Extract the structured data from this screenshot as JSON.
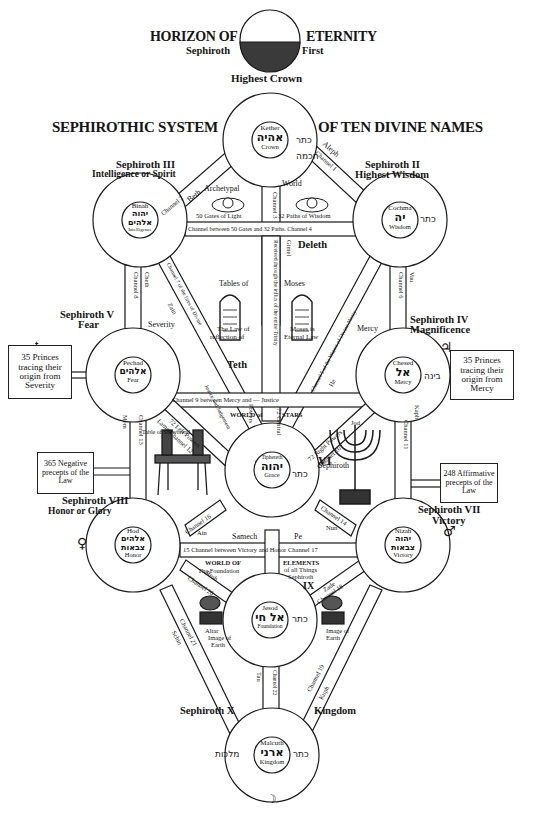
{
  "header": {
    "horizon_left": "HORIZON OF",
    "horizon_right": "ETERNITY",
    "sephiroth_label": "Sephiroth",
    "first_label": "First",
    "highest_crown": "Highest Crown",
    "system_left": "SEPHIROTHIC SYSTEM",
    "system_right": "OF TEN DIVINE NAMES"
  },
  "sephiroth": [
    {
      "id": "keter",
      "name": "Kether",
      "hebrew": "אהיה",
      "english": "Crown",
      "title": "Sephiroth First",
      "subtitle": "Highest Crown"
    },
    {
      "id": "chokmah",
      "name": "Cochma",
      "hebrew": "יה",
      "english": "Wisdom",
      "title": "Sephiroth II",
      "subtitle": "Highest Wisdom"
    },
    {
      "id": "binah",
      "name": "Binah",
      "hebrew": "יהוה אלהים",
      "english": "Intelligence",
      "title": "Sephiroth III",
      "subtitle": "Intelligence or Spirit"
    },
    {
      "id": "chesed",
      "name": "Chesed",
      "hebrew": "אל",
      "english": "Mercy",
      "title": "Sephiroth IV",
      "subtitle": "Magnificence"
    },
    {
      "id": "pechad",
      "name": "Pechad",
      "hebrew": "אלהים",
      "english": "Fear",
      "title": "Sephiroth V",
      "subtitle": "Fear"
    },
    {
      "id": "tiphereth",
      "name": "Tiphereth",
      "hebrew": "יהוה",
      "english": "Grace",
      "title": "Sephiroth",
      "subtitle": "VI"
    },
    {
      "id": "nizah",
      "name": "Nizah",
      "hebrew": "יהוה צבאות",
      "english": "Victory",
      "title": "Sephiroth VII",
      "subtitle": "Victory"
    },
    {
      "id": "hod",
      "name": "Hod",
      "hebrew": "אלהים צבאות",
      "english": "Honor",
      "title": "Sephiroth VIII",
      "subtitle": "Honor or Glory"
    },
    {
      "id": "jesod",
      "name": "Jesod",
      "hebrew": "אל חי",
      "english": "Foundation",
      "title": "Sephiroth",
      "subtitle": "IX"
    },
    {
      "id": "malchuth",
      "name": "Malcuth",
      "hebrew": "ארני",
      "english": "Kingdom",
      "title": "Sephiroth X",
      "subtitle": "Kingdom"
    }
  ],
  "ring_words": [
    "כתר",
    "חכמה",
    "בינה",
    "גדולה",
    "גבורה",
    "תפארת",
    "נצח",
    "הוד",
    "יסוד",
    "מלכות"
  ],
  "channels": {
    "c1": "Channel 1",
    "aleph": "Aleph",
    "c2": "Channel 2",
    "beth": "Beth",
    "c3": "Channel 3",
    "c4": "Channel between 50 Gates and 32 Paths. Channel 4",
    "deleth": "Deleth",
    "gimel": "Gimel",
    "influx": "Received through the influx of the entire Trinity",
    "c5_divine": "Channel 5 of the Waters of Divine Mercy",
    "he": "He",
    "c6": "Channel 6",
    "vau": "Vau",
    "c7": "Channel 7 of the fires of Divine",
    "zain": "Zain",
    "c8": "Channel 8",
    "cheth": "Cheth",
    "c9": "Channel 9 between Mercy and — Justice",
    "teth": "Teth",
    "justice_judgment": "Justice and Judgement",
    "c10": "Channel 10",
    "jod": "Jod",
    "right_powers": "72 Right Powers",
    "c11": "Channel 11",
    "kaph": "Kaph",
    "c12": "Channel 12",
    "lamed": "Lamed",
    "left_powers": "72 Left Powers",
    "c13": "Channel 13",
    "mem": "Mem",
    "c14": "Channel 14",
    "nun": "Nun",
    "c15_17": "15 Channel between Victory and Honor Channel 17",
    "samech": "Samech",
    "pe": "Pe",
    "c16": "Channel 16",
    "ain": "Ain",
    "c18": "Channel 18",
    "zade": "Zade",
    "c19": "Channel 19",
    "kuph": "Kuph",
    "c20": "Channel 20",
    "resh": "Resh",
    "c21": "Channel 21",
    "schin": "Schin",
    "c22": "Channel 22",
    "tau": "Tau",
    "central_col": "72 Central",
    "c5_stars": "Channel 5 of the"
  },
  "labels": {
    "archetypal": "Archetypal",
    "world": "World",
    "gates_light": "50 Gates of Light",
    "paths_wisdom": "32 Paths of Wisdom",
    "tables_of": "Tables of",
    "moses": "Moses",
    "law_reflection_1": "The Law of",
    "law_reflection_2": "reflection of",
    "moses_eternal_1": "Moses is",
    "moses_eternal_2": "Eternal Law",
    "severity": "Severity",
    "mercy": "Mercy",
    "world_of": "WORLD of",
    "powers": "Powers",
    "stars": "STARS",
    "table_shewbread": "Table of Shewbread",
    "world_of_foundation_1": "WORLD OF",
    "world_of_foundation_2": "The Foundation",
    "elements_1": "ELEMENTS",
    "elements_2": "of all Things",
    "elements_3": "Sephiroth",
    "altar_1": "Altar",
    "altar_2": "Image of",
    "altar_3": "Earth",
    "image_earth_1": "Image of",
    "image_earth_2": "Earth"
  },
  "boxes": {
    "princes_severity": "35 Princes tracing their origin from Severity",
    "princes_mercy": "35 Princes tracing their origin from Mercy",
    "negative": "365 Negative precepts of the Law",
    "affirmative": "248 Affirmative precepts of the Law"
  },
  "symbols": {
    "saturn": "♄",
    "jupiter": "♃",
    "venus": "♀",
    "mars": "♂",
    "moon": "☽"
  }
}
